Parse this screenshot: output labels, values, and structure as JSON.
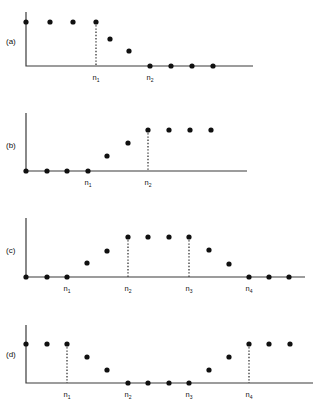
{
  "figure": {
    "title": "",
    "background_color": "#ffffff",
    "ink_color": "#101010",
    "axis_color": "#3b3b3b",
    "width": 322,
    "height": 408
  },
  "panels": [
    {
      "id": "a",
      "label": "(a)",
      "label_x": 6,
      "label_y": 44,
      "axis": {
        "x0": 26,
        "y0": 66,
        "x1": 253,
        "ytop": 12
      },
      "tick_labels": [
        {
          "text": "n",
          "sub": "1",
          "x": 96,
          "y": 80
        },
        {
          "text": "n",
          "sub": "2",
          "x": 150,
          "y": 80
        }
      ],
      "drop_lines": [
        {
          "x": 96,
          "y_top": 22,
          "y_bottom": 66
        }
      ],
      "points": [
        {
          "x": 26,
          "y": 22
        },
        {
          "x": 50,
          "y": 22
        },
        {
          "x": 73,
          "y": 22
        },
        {
          "x": 96,
          "y": 22
        },
        {
          "x": 110,
          "y": 39
        },
        {
          "x": 129,
          "y": 51
        },
        {
          "x": 150,
          "y": 66
        },
        {
          "x": 171,
          "y": 66
        },
        {
          "x": 192,
          "y": 66
        },
        {
          "x": 213,
          "y": 66
        }
      ]
    },
    {
      "id": "b",
      "label": "(b)",
      "label_x": 6,
      "label_y": 148,
      "axis": {
        "x0": 26,
        "y0": 171,
        "x1": 247,
        "ytop": 113
      },
      "tick_labels": [
        {
          "text": "n",
          "sub": "1",
          "x": 88,
          "y": 185
        },
        {
          "text": "n",
          "sub": "2",
          "x": 148,
          "y": 185
        }
      ],
      "drop_lines": [
        {
          "x": 148,
          "y_top": 130,
          "y_bottom": 171
        }
      ],
      "points": [
        {
          "x": 26,
          "y": 171
        },
        {
          "x": 47,
          "y": 171
        },
        {
          "x": 67,
          "y": 171
        },
        {
          "x": 88,
          "y": 171
        },
        {
          "x": 107,
          "y": 156
        },
        {
          "x": 128,
          "y": 143
        },
        {
          "x": 148,
          "y": 130
        },
        {
          "x": 169,
          "y": 130
        },
        {
          "x": 190,
          "y": 130
        },
        {
          "x": 211,
          "y": 130
        }
      ]
    },
    {
      "id": "c",
      "label": "(c)",
      "label_x": 6,
      "label_y": 253,
      "axis": {
        "x0": 26,
        "y0": 277,
        "x1": 305,
        "ytop": 218
      },
      "tick_labels": [
        {
          "text": "n",
          "sub": "1",
          "x": 67,
          "y": 291
        },
        {
          "text": "n",
          "sub": "2",
          "x": 128,
          "y": 291
        },
        {
          "text": "n",
          "sub": "3",
          "x": 189,
          "y": 291
        },
        {
          "text": "n",
          "sub": "4",
          "x": 249,
          "y": 291
        }
      ],
      "drop_lines": [
        {
          "x": 128,
          "y_top": 237,
          "y_bottom": 277
        },
        {
          "x": 189,
          "y_top": 237,
          "y_bottom": 277
        }
      ],
      "points": [
        {
          "x": 26,
          "y": 277
        },
        {
          "x": 47,
          "y": 277
        },
        {
          "x": 67,
          "y": 277
        },
        {
          "x": 87,
          "y": 263
        },
        {
          "x": 107,
          "y": 251
        },
        {
          "x": 128,
          "y": 237
        },
        {
          "x": 148,
          "y": 237
        },
        {
          "x": 169,
          "y": 237
        },
        {
          "x": 189,
          "y": 237
        },
        {
          "x": 209,
          "y": 250
        },
        {
          "x": 229,
          "y": 264
        },
        {
          "x": 249,
          "y": 277
        },
        {
          "x": 269,
          "y": 277
        },
        {
          "x": 289,
          "y": 277
        }
      ]
    },
    {
      "id": "d",
      "label": "(d)",
      "label_x": 6,
      "label_y": 357,
      "axis": {
        "x0": 26,
        "y0": 383,
        "x1": 313,
        "ytop": 325
      },
      "tick_labels": [
        {
          "text": "n",
          "sub": "1",
          "x": 67,
          "y": 397
        },
        {
          "text": "n",
          "sub": "2",
          "x": 128,
          "y": 397
        },
        {
          "text": "n",
          "sub": "3",
          "x": 189,
          "y": 397
        },
        {
          "text": "n",
          "sub": "4",
          "x": 249,
          "y": 397
        }
      ],
      "drop_lines": [
        {
          "x": 67,
          "y_top": 344,
          "y_bottom": 383
        },
        {
          "x": 249,
          "y_top": 344,
          "y_bottom": 383
        }
      ],
      "points": [
        {
          "x": 26,
          "y": 344
        },
        {
          "x": 47,
          "y": 344
        },
        {
          "x": 67,
          "y": 344
        },
        {
          "x": 87,
          "y": 357
        },
        {
          "x": 107,
          "y": 370
        },
        {
          "x": 128,
          "y": 383
        },
        {
          "x": 148,
          "y": 383
        },
        {
          "x": 169,
          "y": 383
        },
        {
          "x": 189,
          "y": 383
        },
        {
          "x": 209,
          "y": 370
        },
        {
          "x": 229,
          "y": 357
        },
        {
          "x": 249,
          "y": 344
        },
        {
          "x": 269,
          "y": 344
        },
        {
          "x": 290,
          "y": 344
        }
      ]
    }
  ],
  "chart_data": {
    "type": "scatter",
    "title": "",
    "xlabel": "",
    "ylabel": "",
    "grid": false,
    "legend": "none",
    "subplots": [
      {
        "id": "a",
        "label": "(a)",
        "breakpoints": [
          "n1",
          "n2"
        ],
        "x": [
          0,
          1,
          2,
          3,
          4,
          5,
          6,
          7,
          8,
          9
        ],
        "y": [
          1.0,
          1.0,
          1.0,
          1.0,
          0.62,
          0.34,
          0.0,
          0.0,
          0.0,
          0.0
        ],
        "breakpoint_indices": [
          3,
          6
        ]
      },
      {
        "id": "b",
        "label": "(b)",
        "breakpoints": [
          "n1",
          "n2"
        ],
        "x": [
          0,
          1,
          2,
          3,
          4,
          5,
          6,
          7,
          8,
          9
        ],
        "y": [
          0.0,
          0.0,
          0.0,
          0.0,
          0.37,
          0.68,
          1.0,
          1.0,
          1.0,
          1.0
        ],
        "breakpoint_indices": [
          3,
          6
        ]
      },
      {
        "id": "c",
        "label": "(c)",
        "breakpoints": [
          "n1",
          "n2",
          "n3",
          "n4"
        ],
        "x": [
          0,
          1,
          2,
          3,
          4,
          5,
          6,
          7,
          8,
          9,
          10,
          11,
          12,
          13
        ],
        "y": [
          0.0,
          0.0,
          0.0,
          0.35,
          0.65,
          1.0,
          1.0,
          1.0,
          1.0,
          0.68,
          0.33,
          0.0,
          0.0,
          0.0
        ],
        "breakpoint_indices": [
          2,
          5,
          8,
          11
        ]
      },
      {
        "id": "d",
        "label": "(d)",
        "breakpoints": [
          "n1",
          "n2",
          "n3",
          "n4"
        ],
        "x": [
          0,
          1,
          2,
          3,
          4,
          5,
          6,
          7,
          8,
          9,
          10,
          11,
          12,
          13
        ],
        "y": [
          1.0,
          1.0,
          1.0,
          0.67,
          0.33,
          0.0,
          0.0,
          0.0,
          0.0,
          0.33,
          0.67,
          1.0,
          1.0,
          1.0
        ],
        "breakpoint_indices": [
          2,
          5,
          8,
          11
        ]
      }
    ]
  }
}
